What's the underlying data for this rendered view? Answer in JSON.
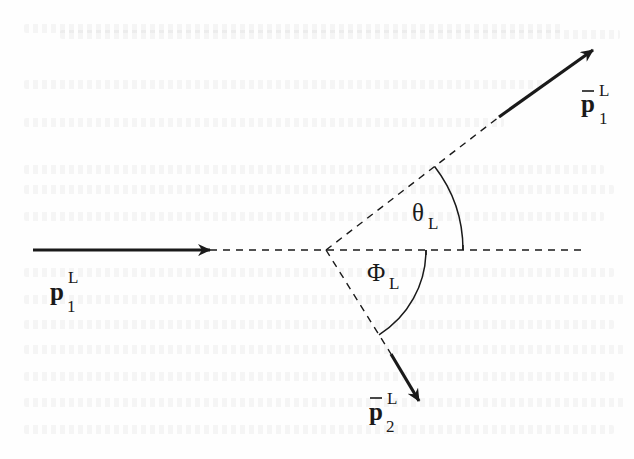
{
  "figure": {
    "colors": {
      "ink": "#1a1a1a",
      "background": "#fefefe"
    },
    "vertex": {
      "x": 326,
      "y": 250
    },
    "vectors": [
      {
        "id": "p1",
        "symbol": "p",
        "bar": false,
        "superscript": "L",
        "subscript": "1",
        "label_text": "p1^L",
        "style": "solid",
        "from": [
          33,
          250
        ],
        "to": [
          210,
          250
        ]
      },
      {
        "id": "pbar1",
        "symbol": "p",
        "bar": true,
        "superscript": "L",
        "subscript": "1",
        "label_text": "p̄1^L",
        "style": "solid",
        "from": [
          499,
          117
        ],
        "to": [
          593,
          50
        ]
      },
      {
        "id": "pbar2",
        "symbol": "p",
        "bar": true,
        "superscript": "L",
        "subscript": "2",
        "label_text": "p̄2^L",
        "style": "solid",
        "from": [
          391,
          354
        ],
        "to": [
          419,
          401
        ]
      }
    ],
    "dashed_lines": [
      {
        "id": "axis",
        "from": [
          210,
          250
        ],
        "to": [
          585,
          250
        ]
      },
      {
        "id": "pbar1-direction",
        "from": [
          326,
          250
        ],
        "to": [
          499,
          117
        ]
      },
      {
        "id": "pbar2-direction",
        "from": [
          326,
          250
        ],
        "to": [
          391,
          354
        ]
      }
    ],
    "angles": [
      {
        "id": "theta",
        "symbol": "θ",
        "subscript": "L",
        "label_text": "θ_L",
        "radius": 137,
        "between": [
          "axis",
          "pbar1-direction"
        ],
        "position": "above axis"
      },
      {
        "id": "phi",
        "symbol": "Φ",
        "subscript": "L",
        "label_text": "Φ_L",
        "radius": 100,
        "between": [
          "axis",
          "pbar2-direction"
        ],
        "position": "below axis"
      }
    ]
  },
  "labels": {
    "p1": {
      "base": "p",
      "sup": "L",
      "sub": "1"
    },
    "pbar1": {
      "base": "p",
      "sup": "L",
      "sub": "1"
    },
    "pbar2": {
      "base": "p",
      "sup": "L",
      "sub": "2"
    },
    "theta": {
      "base": "θ",
      "sub": "L"
    },
    "phi": {
      "base": "Φ",
      "sub": "L"
    }
  }
}
